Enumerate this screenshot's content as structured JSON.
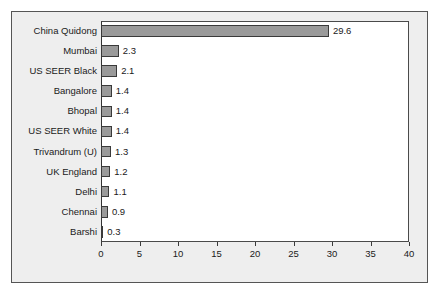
{
  "chart_data": {
    "type": "bar",
    "orientation": "horizontal",
    "title": "",
    "xlabel": "",
    "ylabel": "",
    "xlim": [
      0,
      40
    ],
    "xticks": [
      0,
      5,
      10,
      15,
      20,
      25,
      30,
      35,
      40
    ],
    "grid": false,
    "legend": null,
    "show_data_labels": true,
    "categories": [
      "China Quidong",
      "Mumbai",
      "US SEER Black",
      "Bangalore",
      "Bhopal",
      "US SEER White",
      "Trivandrum (U)",
      "UK England",
      "Delhi",
      "Chennai",
      "Barshi"
    ],
    "values": [
      29.6,
      2.3,
      2.1,
      1.4,
      1.4,
      1.4,
      1.3,
      1.2,
      1.1,
      0.9,
      0.3
    ],
    "data_labels": [
      "29.6",
      "2.3",
      "2.1",
      "1.4",
      "1.4",
      "1.4",
      "1.3",
      "1.2",
      "1.1",
      "0.9",
      "0.3"
    ],
    "tick_labels": [
      "0",
      "5",
      "10",
      "15",
      "20",
      "25",
      "30",
      "35",
      "40"
    ]
  },
  "style": {
    "bar_fill": "#9a9a9a",
    "bar_border": "#3a3a3a",
    "plot_background": "#ffffff",
    "figure_background": "#eeeeee",
    "frame_border": "#555555",
    "axis_color": "#3a3a3a",
    "text_color": "#1a1a1a"
  }
}
